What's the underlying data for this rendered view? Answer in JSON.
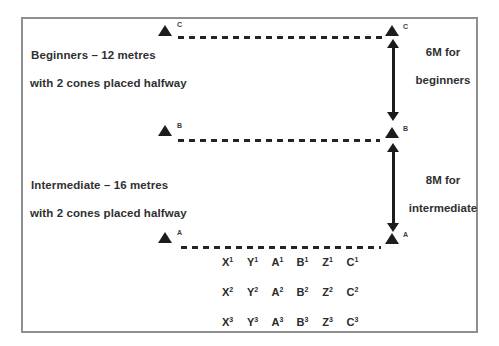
{
  "colors": {
    "frame_border": "#8f8f8f",
    "ink": "#2e2e2e",
    "cone_fill": "#1c1c1c"
  },
  "labels": {
    "beginners_title": "Beginners – 12 metres",
    "beginners_sub": "with 2 cones placed halfway",
    "intermediate_title": "Intermediate – 16 metres",
    "intermediate_sub": "with 2 cones placed halfway",
    "beginners_gap_line1": "6M for",
    "beginners_gap_line2": "beginners",
    "intermediate_gap_line1": "8M for",
    "intermediate_gap_line2": "intermediate"
  },
  "cone_lines": [
    {
      "name": "C",
      "left_label": "C",
      "right_label": "C"
    },
    {
      "name": "B",
      "left_label": "B",
      "right_label": "B"
    },
    {
      "name": "A",
      "left_label": "A",
      "right_label": "A"
    }
  ],
  "grid": {
    "rows": [
      {
        "cells": [
          {
            "b": "X",
            "s": "1"
          },
          {
            "b": "Y",
            "s": "1"
          },
          {
            "b": "A",
            "s": "1"
          },
          {
            "b": "B",
            "s": "1"
          },
          {
            "b": "Z",
            "s": "1"
          },
          {
            "b": "C",
            "s": "1"
          }
        ]
      },
      {
        "cells": [
          {
            "b": "X",
            "s": "2"
          },
          {
            "b": "Y",
            "s": "2"
          },
          {
            "b": "A",
            "s": "2"
          },
          {
            "b": "B",
            "s": "2"
          },
          {
            "b": "Z",
            "s": "2"
          },
          {
            "b": "C",
            "s": "2"
          }
        ]
      },
      {
        "cells": [
          {
            "b": "X",
            "s": "3"
          },
          {
            "b": "Y",
            "s": "3"
          },
          {
            "b": "A",
            "s": "3"
          },
          {
            "b": "B",
            "s": "3"
          },
          {
            "b": "Z",
            "s": "3"
          },
          {
            "b": "C",
            "s": "3"
          }
        ]
      }
    ]
  }
}
